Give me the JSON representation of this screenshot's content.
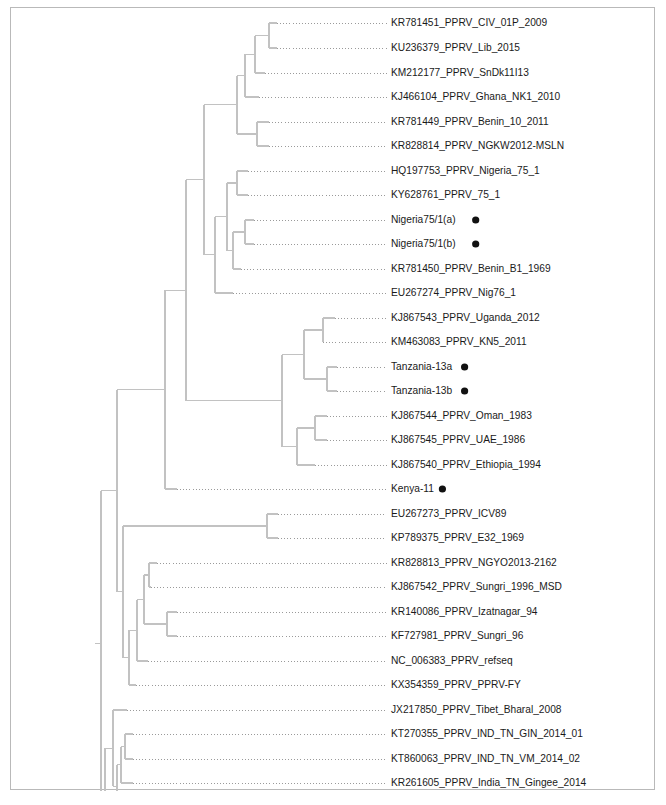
{
  "figure": {
    "type": "phylogenetic-tree",
    "orientation": "rectangular-cladogram-left-to-right",
    "border_color": "#b9b9b9",
    "branch_color": "#c2c2c2",
    "leader_color": "#9a9a9a",
    "label_color": "#1a1a1a",
    "background_color": "#ffffff",
    "marker_color": "#111111",
    "marker_glyph": "●",
    "marker_meaning_note": "filled circle marks study isolate"
  },
  "chart_data": {
    "type": "tree",
    "title": "",
    "xlabel": "",
    "ylabel": "",
    "grid": false,
    "legend": false,
    "tip_count": 34,
    "tips": [
      {
        "index": 0,
        "label": "KR781451_PPRV_CIV_01P_2009",
        "marker": false,
        "y": 22,
        "branch_x": 276
      },
      {
        "index": 1,
        "label": "KU236379_PPRV_Lib_2015",
        "marker": false,
        "y": 47,
        "branch_x": 276
      },
      {
        "index": 2,
        "label": "KM212177_PPRV_SnDk11I13",
        "marker": false,
        "y": 72,
        "branch_x": 264
      },
      {
        "index": 3,
        "label": "KJ466104_PPRV_Ghana_NK1_2010",
        "marker": false,
        "y": 96,
        "branch_x": 258
      },
      {
        "index": 4,
        "label": "KR781449_PPRV_Benin_10_2011",
        "marker": false,
        "y": 121,
        "branch_x": 268
      },
      {
        "index": 5,
        "label": "KR828814_PPRV_NGKW2012-MSLN",
        "marker": false,
        "y": 145,
        "branch_x": 268
      },
      {
        "index": 6,
        "label": "HQ197753_PPRV_Nigeria_75_1",
        "marker": false,
        "y": 170,
        "branch_x": 247
      },
      {
        "index": 7,
        "label": "KY628761_PPRV_75_1",
        "marker": false,
        "y": 194,
        "branch_x": 247
      },
      {
        "index": 8,
        "label": "Nigeria75/1(a)",
        "marker": true,
        "y": 219,
        "branch_x": 253
      },
      {
        "index": 9,
        "label": "Nigeria75/1(b)",
        "marker": true,
        "y": 243,
        "branch_x": 253
      },
      {
        "index": 10,
        "label": "KR781450_PPRV_Benin_B1_1969",
        "marker": false,
        "y": 268,
        "branch_x": 240
      },
      {
        "index": 11,
        "label": "EU267274_PPRV_Nig76_1",
        "marker": false,
        "y": 292,
        "branch_x": 232
      },
      {
        "index": 12,
        "label": "KJ867543_PPRV_Uganda_2012",
        "marker": false,
        "y": 317,
        "branch_x": 334
      },
      {
        "index": 13,
        "label": "KM463083_PPRV_KN5_2011",
        "marker": false,
        "y": 341,
        "branch_x": 322
      },
      {
        "index": 14,
        "label": "Tanzania-13a",
        "marker": true,
        "y": 366,
        "branch_x": 336
      },
      {
        "index": 15,
        "label": "Tanzania-13b",
        "marker": true,
        "y": 390,
        "branch_x": 336
      },
      {
        "index": 16,
        "label": "KJ867544_PPRV_Oman_1983",
        "marker": false,
        "y": 415,
        "branch_x": 326
      },
      {
        "index": 17,
        "label": "KJ867545_PPRV_UAE_1986",
        "marker": false,
        "y": 439,
        "branch_x": 326
      },
      {
        "index": 18,
        "label": "KJ867540_PPRV_Ethiopia_1994",
        "marker": false,
        "y": 464,
        "branch_x": 314
      },
      {
        "index": 19,
        "label": "Kenya-11",
        "marker": true,
        "y": 488,
        "branch_x": 176
      },
      {
        "index": 20,
        "label": "EU267273_PPRV_ICV89",
        "marker": false,
        "y": 513,
        "branch_x": 277
      },
      {
        "index": 21,
        "label": "KP789375_PPRV_E32_1969",
        "marker": false,
        "y": 537,
        "branch_x": 277
      },
      {
        "index": 22,
        "label": "KR828813_PPRV_NGYO2013-2162",
        "marker": false,
        "y": 562,
        "branch_x": 156
      },
      {
        "index": 23,
        "label": "KJ867542_PPRV_Sungri_1996_MSD",
        "marker": false,
        "y": 586,
        "branch_x": 150
      },
      {
        "index": 24,
        "label": "KR140086_PPRV_Izatnagar_94",
        "marker": false,
        "y": 611,
        "branch_x": 176
      },
      {
        "index": 25,
        "label": "KF727981_PPRV_Sungri_96",
        "marker": false,
        "y": 635,
        "branch_x": 176
      },
      {
        "index": 26,
        "label": "NC_006383_PPRV_refseq",
        "marker": false,
        "y": 660,
        "branch_x": 147
      },
      {
        "index": 27,
        "label": "KX354359_PPRV_PPRV-FY",
        "marker": false,
        "y": 684,
        "branch_x": 135
      },
      {
        "index": 28,
        "label": "JX217850_PPRV_Tibet_Bharal_2008",
        "marker": false,
        "y": 709,
        "branch_x": 126
      },
      {
        "index": 29,
        "label": "KT270355_PPRV_IND_TN_GIN_2014_01",
        "marker": false,
        "y": 733,
        "branch_x": 132
      },
      {
        "index": 30,
        "label": "KT860063_PPRV_IND_TN_VM_2014_02",
        "marker": false,
        "y": 758,
        "branch_x": 132
      },
      {
        "index": 31,
        "label": "KR261605_PPRV_India_TN_Gingee_2014",
        "marker": false,
        "y": 782,
        "branch_x": 132
      },
      {
        "index": 32,
        "label": "KX033350_PPRV_IND_Delhi_2016_05",
        "marker": false,
        "y": 807,
        "branch_x": 126
      },
      {
        "index": 33,
        "label": "KT860064_PPRV_IND_TN_VEL_2015_03",
        "marker": false,
        "y": 831,
        "branch_x": 124
      },
      {
        "index": 34,
        "label": "KT860065_PPRV_IND_TN_ED_2015_04",
        "marker": false,
        "y": 856,
        "branch_x": 124
      }
    ],
    "label_x": 390
  }
}
